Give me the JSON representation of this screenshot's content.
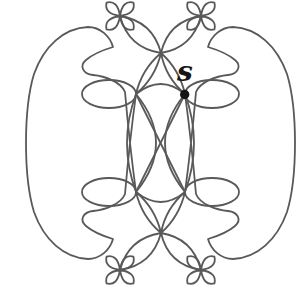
{
  "figure": {
    "canvas": {
      "width": 298,
      "height": 297,
      "background": "#ffffff"
    },
    "stroke": {
      "color": "#595959",
      "width": 1.8
    },
    "label": {
      "text": "s",
      "x": 177,
      "y": 81,
      "color": "#161616"
    },
    "point": {
      "name": "base-point-s",
      "d": "M180,94.5 a4.7,4.7 0 1,0 9.4,0 a4.7,4.7 0 1,0 -9.4,0",
      "color": "#161616"
    },
    "paths": {
      "outer_left": "M136,192 C131,155 127,115 125,92 C121,82 105,76 93,75 C83,74 79,66 86,60 C93,54 103,50 113,47 C110,36 100,27 88,27 C64,28 44,46 34,74 C27,97 26,120 26,143 C26,166 27,189 34,212 C44,240 64,258 88,259 C100,259 110,250 113,239 C103,236 93,232 86,226 C79,220 83,212 93,211 C105,210 121,204 125,194 C127,171 131,131 136,94",
      "outer_right": "M185,192 C190,155 194,115 196,92 C200,82 216,76 228,75 C238,74 242,66 235,60 C228,54 218,50 208,47 C211,36 221,27 233,27 C257,28 277,46 287,74 C294,97 295,120 295,143 C295,166 294,189 287,212 C277,240 257,258 233,259 C221,259 211,250 208,239 C218,236 228,232 235,226 C242,220 238,212 228,211 C216,210 200,204 196,194 C194,171 190,131 185,94",
      "rosette_top_left": "M120,16 Q117.5,-0.3 106.6,2.6 Q103.7,13.5 120,16 Q103.7,18.5 106.6,29.4 Q117.5,32.3 120,16 Q122.5,32.3 133.4,29.4 Q136.3,18.5 120,16 Q136.3,13.5 133.4,2.6 Q122.5,-0.3 120,16 Z",
      "rosette_top_right": "M201,16 Q198.5,-0.3 187.6,2.6 Q184.7,13.5 201,16 Q184.7,18.5 187.6,29.4 Q198.5,32.3 201,16 Q203.5,32.3 214.4,29.4 Q217.3,18.5 201,16 Q217.3,13.5 214.4,2.6 Q203.5,-0.3 201,16 Z",
      "rosette_bottom_left": "M120,270 Q117.5,253.7 106.6,256.6 Q103.7,267.5 120,270 Q103.7,272.5 106.6,283.4 Q117.5,286.3 120,270 Q122.5,286.3 133.4,283.4 Q136.3,272.5 120,270 Q136.3,267.5 133.4,256.6 Q122.5,253.7 120,270 Z",
      "rosette_bottom_right": "M201,270 Q198.5,253.7 187.6,256.6 Q184.7,267.5 201,270 Q184.7,272.5 187.6,283.4 Q198.5,286.3 201,270 Q203.5,286.3 214.4,283.4 Q217.3,272.5 201,270 Q217.3,267.5 214.4,256.6 Q203.5,253.7 201,270 Z",
      "leaf_top_left": "M161,53 Q152.6,21.1 120,16 Q128.4,47.9 161,53 Z",
      "leaf_top_right": "M161,53 Q168.4,21.1 201,16 Q192.6,47.9 161,53 Z",
      "leaf_bottom_left": "M161,233 Q152.6,264.9 120,270 Q128.4,238.1 161,233 Z",
      "leaf_bottom_right": "M161,233 Q168.4,264.9 201,270 Q192.6,238.1 161,233 Z",
      "petal_top_to_ul": "M161,53 Q141.7,69.3 136,94 Q155.3,77.7 161,53 Z",
      "petal_top_to_ur": "M161,53 Q179.3,69.3 185,94 Q165.7,77.7 161,53 Z",
      "petal_bottom_to_ll": "M161,233 Q141.7,216.7 136,192 Q155.3,208.3 161,233 Z",
      "petal_bottom_to_lr": "M161,233 Q179.3,216.7 185,192 Q165.7,208.3 161,233 Z",
      "lens_left": "M136,94 Q118,143 136,192 Q176,143 136,94 Z",
      "lens_right": "M185,94 Q203,143 185,192 Q145,143 185,94 Z",
      "ellipse_upper_left": "M82,94 a27,14 0 1,0 54,0 a27,14 0 1,0 -54,0",
      "ellipse_upper_right": "M185,94 a27,14 0 1,0 54,0 a27,14 0 1,0 -54,0",
      "ellipse_lower_left": "M82,192 a27,14 0 1,0 54,0 a27,14 0 1,0 -54,0",
      "ellipse_lower_right": "M185,192 a27,14 0 1,0 54,0 a27,14 0 1,0 -54,0",
      "arc_upper_nodes": "M136,94 Q161,74 185,94",
      "arc_lower_nodes": "M136,192 Q161,212 185,192",
      "diagonal_ul_lr": "M136,94 L185,192",
      "diagonal_ur_ll": "M185,94 L136,192"
    }
  }
}
